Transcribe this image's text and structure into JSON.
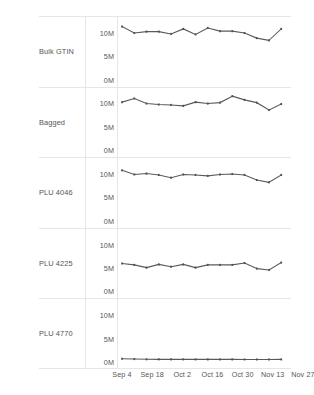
{
  "chart_data": {
    "type": "line",
    "title": "",
    "subtitle": "",
    "xlabel": "",
    "ylabel": "",
    "layout": "small-multiples-vertical",
    "grid": false,
    "legend": "none",
    "facet_labels": [
      "Bulk GTIN",
      "Bagged",
      "PLU 4046",
      "PLU 4225",
      "PLU 4770"
    ],
    "y_ticks": [
      "0M",
      "5M",
      "10M"
    ],
    "y_tick_values": [
      0,
      5000000,
      10000000
    ],
    "ylim": [
      0,
      12500000
    ],
    "x_tick_labels": [
      "Sep 4",
      "Sep 18",
      "Oct 2",
      "Oct 16",
      "Oct 30",
      "Nov 13",
      "Nov 27"
    ],
    "x_tick_indices": [
      0,
      2,
      4,
      6,
      8,
      10,
      12
    ],
    "x": [
      "Sep 4",
      "Sep 11",
      "Sep 18",
      "Sep 25",
      "Oct 2",
      "Oct 9",
      "Oct 16",
      "Oct 23",
      "Oct 30",
      "Nov 6",
      "Nov 13",
      "Nov 20",
      "Nov 27",
      "Dec 4"
    ],
    "series": [
      {
        "name": "Bulk GTIN",
        "color": "#5a5a5a",
        "values": [
          11500000,
          10100000,
          10400000,
          10400000,
          9900000,
          11000000,
          9800000,
          11200000,
          10500000,
          10500000,
          10100000,
          9000000,
          8500000,
          11000000
        ]
      },
      {
        "name": "Bagged",
        "color": "#5a5a5a",
        "values": [
          10500000,
          11300000,
          10200000,
          10000000,
          9900000,
          9700000,
          10500000,
          10200000,
          10400000,
          11800000,
          11000000,
          10400000,
          8800000,
          10100000
        ]
      },
      {
        "name": "PLU 4046",
        "color": "#5a5a5a",
        "values": [
          10900000,
          10000000,
          10200000,
          9900000,
          9300000,
          10000000,
          9900000,
          9700000,
          10000000,
          10100000,
          9900000,
          8800000,
          8300000,
          9900000
        ]
      },
      {
        "name": "PLU 4225",
        "color": "#5a5a5a",
        "values": [
          6100000,
          5800000,
          5200000,
          5900000,
          5400000,
          5900000,
          5200000,
          5800000,
          5800000,
          5800000,
          6200000,
          5000000,
          4700000,
          6300000
        ]
      },
      {
        "name": "PLU 4770",
        "color": "#5a5a5a",
        "values": [
          450000,
          380000,
          330000,
          320000,
          310000,
          310000,
          300000,
          300000,
          300000,
          300000,
          290000,
          290000,
          290000,
          300000
        ]
      }
    ]
  },
  "axis": {
    "y_label_0": "0M",
    "y_label_5": "5M",
    "y_label_10": "10M"
  },
  "rows": [
    {
      "label": "Bulk GTIN"
    },
    {
      "label": "Bagged"
    },
    {
      "label": "PLU 4046"
    },
    {
      "label": "PLU 4225"
    },
    {
      "label": "PLU 4770"
    }
  ],
  "x_labels": [
    "Sep 4",
    "Sep 18",
    "Oct 2",
    "Oct 16",
    "Oct 30",
    "Nov 13",
    "Nov 27"
  ]
}
